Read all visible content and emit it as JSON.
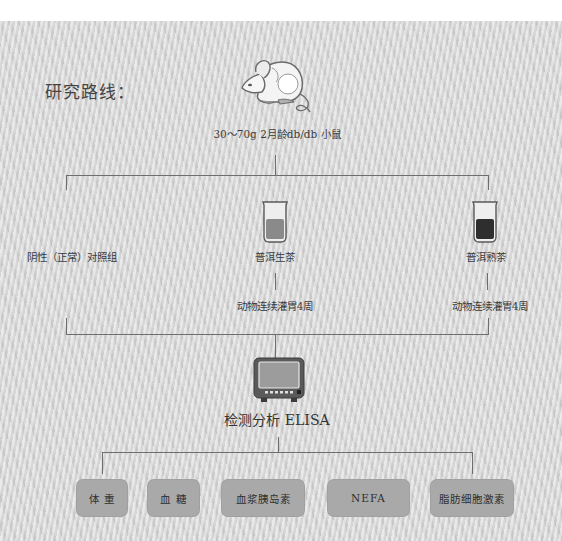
{
  "diagram": {
    "title": "研究路线：",
    "subject": {
      "icon": "mouse-icon",
      "label": "30～70g 2月龄db/db 小鼠"
    },
    "groups": [
      {
        "label": "阴性（正常）对照组",
        "icon": null,
        "treatment": null
      },
      {
        "label": "普洱生茶",
        "icon": "beaker-icon",
        "liquid_color": "#8a8a8a",
        "treatment": "动物连续灌胃4周"
      },
      {
        "label": "普洱熟茶",
        "icon": "beaker-icon",
        "liquid_color": "#2e2e2e",
        "treatment": "动物连续灌胃4周"
      }
    ],
    "analysis": {
      "icon": "monitor-icon",
      "label": "检测分析 ELISA"
    },
    "measurements": [
      {
        "label": "体 重"
      },
      {
        "label": "血 糖"
      },
      {
        "label": "血浆胰岛素"
      },
      {
        "label": "NEFA"
      },
      {
        "label": "脂肪细胞激素"
      }
    ],
    "colors": {
      "background": "#d8d8d8",
      "line": "#6e6e6e",
      "box": "#a9a9a9",
      "text": "#333333"
    }
  }
}
